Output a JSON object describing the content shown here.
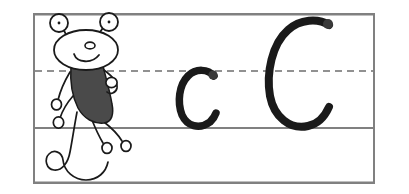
{
  "worksheet": {
    "title": "Letter C Handwriting Practice",
    "subject": "Handwriting practice worksheet for the letter C",
    "background_color": "#ffffff",
    "canvas": {
      "width": 409,
      "height": 194
    }
  },
  "ruling": {
    "frame": {
      "label": "Writing frame",
      "x": 33,
      "y": 13,
      "width": 342,
      "height": 171,
      "stroke_color": "#808080",
      "stroke_width": 2
    },
    "top_line": {
      "label": "Top line",
      "y": 14,
      "style": "solid",
      "color": "#808080"
    },
    "mid_line": {
      "label": "Dashed midline",
      "y": 71,
      "style": "dashed",
      "color": "#6e6e6e",
      "dash_pattern": "7 5"
    },
    "base_line": {
      "label": "Baseline",
      "y": 128,
      "style": "solid",
      "color": "#808080"
    },
    "bottom_line": {
      "label": "Descender bottom line",
      "y": 183,
      "style": "solid",
      "color": "#808080"
    }
  },
  "mascot": {
    "name": "Cartoon creature mascot",
    "description": "Smiling cartoon creature with two stalk eyes, dark gray body, looped hands and feet, and a curly tail",
    "body_fill": "#4a4a4a",
    "outline_color": "#1a1a1a",
    "face_fill": "#ffffff",
    "parts": [
      "left-eye-stalk",
      "right-eye-stalk",
      "head",
      "nose",
      "mouth",
      "body",
      "left-arm",
      "right-arm",
      "left-leg",
      "right-leg",
      "tail"
    ]
  },
  "letters": [
    {
      "id": "lowercase-c",
      "character": "c",
      "case": "lowercase",
      "stroke_color": "#1a1a1a",
      "zone": "midline-to-baseline",
      "x": 178,
      "y": 68,
      "width": 40,
      "height": 62
    },
    {
      "id": "uppercase-c",
      "character": "C",
      "case": "uppercase",
      "stroke_color": "#1a1a1a",
      "zone": "topline-to-baseline",
      "x": 263,
      "y": 16,
      "width": 70,
      "height": 114
    }
  ]
}
